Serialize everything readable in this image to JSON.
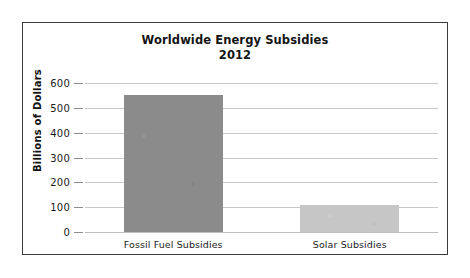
{
  "chart_data": {
    "type": "bar",
    "title": "Worldwide Energy Subsidies",
    "title_line1": "Worldwide Energy Subsidies",
    "title_line2": "2012",
    "categories": [
      "Fossil Fuel Subsidies",
      "Solar Subsidies"
    ],
    "values": [
      550,
      110
    ],
    "series": [
      {
        "name": "Subsidies",
        "values": [
          550,
          110
        ]
      }
    ],
    "xlabel": "",
    "ylabel": "Billions of Dollars",
    "ylim": [
      0,
      600
    ],
    "yticks": [
      0,
      100,
      200,
      300,
      400,
      500,
      600
    ],
    "ytick_labels": [
      "0",
      "100",
      "200",
      "300",
      "400",
      "500",
      "600"
    ],
    "grid": true,
    "legend": false,
    "legend_position": "none",
    "colors": {
      "bar_fossil": "#8b8b8b",
      "bar_solar": "#c6c6c6",
      "gridline": "#c9c9c9",
      "border": "#3a3a3a",
      "background": "#ffffff",
      "text": "#141414"
    }
  }
}
